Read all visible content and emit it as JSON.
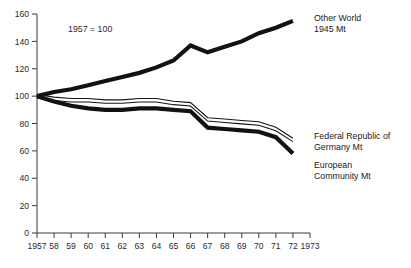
{
  "chart_data": {
    "type": "line",
    "title": "",
    "subtitle": "",
    "annotation": "1957 = 100",
    "xlabel": "",
    "ylabel": "",
    "xlim": [
      1957,
      1973
    ],
    "ylim": [
      0,
      160
    ],
    "grid": false,
    "legend_position": "right-inline",
    "y_ticks": [
      0,
      20,
      40,
      60,
      80,
      100,
      120,
      140,
      160
    ],
    "y_tick_labels": [
      "0",
      "20",
      "40",
      "60",
      "80",
      "100",
      "120",
      "140",
      "160"
    ],
    "x": [
      1957,
      1958,
      1959,
      1960,
      1961,
      1962,
      1963,
      1964,
      1965,
      1966,
      1967,
      1968,
      1969,
      1970,
      1971,
      1972,
      1973
    ],
    "x_tick_labels": [
      "1957",
      "58",
      "59",
      "60",
      "61",
      "62",
      "63",
      "64",
      "65",
      "66",
      "67",
      "68",
      "69",
      "70",
      "71",
      "72",
      "1973"
    ],
    "series": [
      {
        "name": "Other World",
        "label_line1": "Other World",
        "label_line2": "1945 Mt",
        "style": "thick",
        "color": "#121212",
        "x": [
          1957,
          1958,
          1959,
          1960,
          1961,
          1962,
          1963,
          1964,
          1965,
          1966,
          1967,
          1968,
          1969,
          1970,
          1971,
          1972
        ],
        "values": [
          100,
          103,
          105,
          108,
          111,
          114,
          117,
          121,
          126,
          137,
          132,
          136,
          140,
          146,
          150,
          155
        ]
      },
      {
        "name": "Federal Republic of Germany",
        "label_line1": "Federal Republic of",
        "label_line2": "Germany Mt",
        "style": "thin",
        "color": "#151515",
        "x": [
          1957,
          1958,
          1959,
          1960,
          1961,
          1962,
          1963,
          1964,
          1965,
          1966,
          1967,
          1968,
          1969,
          1970,
          1971,
          1972
        ],
        "values": [
          100,
          98,
          97,
          97,
          96,
          96,
          97,
          97,
          95,
          94,
          83,
          82,
          81,
          80,
          76,
          68
        ]
      },
      {
        "name": "European Community",
        "label_line1": "European",
        "label_line2": "Community Mt",
        "style": "thick",
        "color": "#121212",
        "x": [
          1957,
          1958,
          1959,
          1960,
          1961,
          1962,
          1963,
          1964,
          1965,
          1966,
          1967,
          1968,
          1969,
          1970,
          1971,
          1972
        ],
        "values": [
          100,
          96,
          93,
          91,
          90,
          90,
          91,
          91,
          90,
          89,
          77,
          76,
          75,
          74,
          70,
          58
        ]
      }
    ]
  }
}
